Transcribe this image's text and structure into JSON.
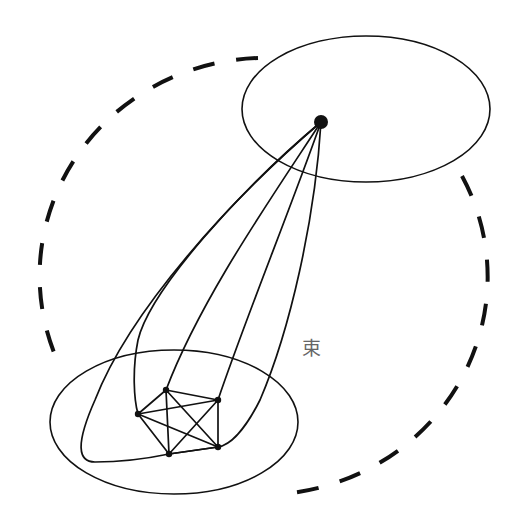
{
  "diagram": {
    "label": "束",
    "label_pos": {
      "x": 302,
      "y": 339
    },
    "colors": {
      "stroke": "#111111",
      "label": "#666666",
      "background": "#ffffff"
    },
    "dashed_boundary": {
      "cx": 263,
      "cy": 276,
      "rx": 226,
      "ry": 218,
      "dash": "22 22"
    },
    "top_ellipse": {
      "cx": 366,
      "cy": 109,
      "rx": 124,
      "ry": 73
    },
    "bottom_ellipse": {
      "cx": 174,
      "cy": 422,
      "rx": 124,
      "ry": 72
    },
    "apex_node": {
      "x": 321,
      "y": 122,
      "r": 7
    },
    "cluster_nodes": [
      {
        "id": "a",
        "x": 166,
        "y": 390
      },
      {
        "id": "b",
        "x": 218,
        "y": 400
      },
      {
        "id": "c",
        "x": 138,
        "y": 414
      },
      {
        "id": "d",
        "x": 169,
        "y": 454
      },
      {
        "id": "e",
        "x": 218,
        "y": 447
      }
    ]
  }
}
